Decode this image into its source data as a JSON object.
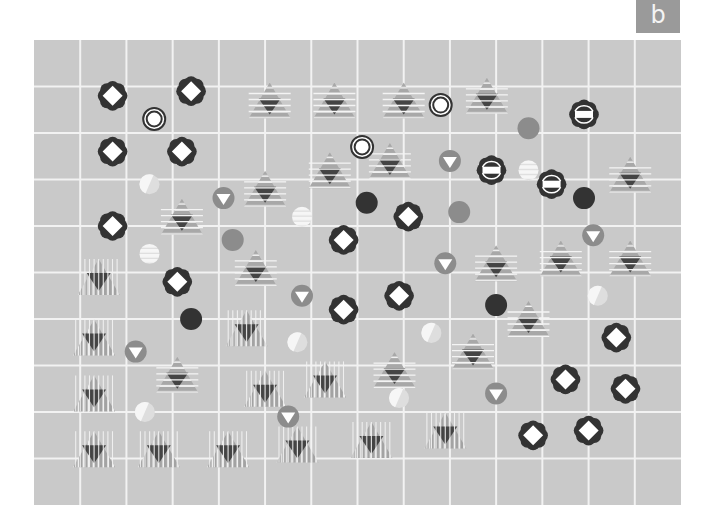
{
  "panel": {
    "label": "b"
  },
  "grid": {
    "columns": 14,
    "rows": 10
  },
  "colors": {
    "background": "#c9c9c9",
    "grid_line": "#f2f2f2",
    "dark": "#333333",
    "mid": "#8c8c8c",
    "stripe_light": "#a8a8a8",
    "light": "#eeeeee",
    "white": "#ffffff"
  },
  "symbol_types": {
    "flower": "dark flower with white diamond",
    "flower-bar": "dark flower with white bar",
    "ring": "double ring",
    "htri": "horizontally striped triangle with dark inner triangle",
    "vtri": "vertically striped triangle with dark inner triangle",
    "tri-down-circle": "gray circle with white down-triangle",
    "dot-dark": "dark circle",
    "dot-mid": "medium gray circle",
    "dot-light-half": "pale half-white circle",
    "dot-light-striped": "pale striped circle"
  },
  "symbols": [
    {
      "type": "flower",
      "col": 1.7,
      "row": 1.2
    },
    {
      "type": "flower",
      "col": 3.4,
      "row": 1.1
    },
    {
      "type": "flower",
      "col": 1.7,
      "row": 2.4
    },
    {
      "type": "flower",
      "col": 3.2,
      "row": 2.4
    },
    {
      "type": "flower",
      "col": 1.7,
      "row": 4.0
    },
    {
      "type": "flower",
      "col": 6.7,
      "row": 4.3
    },
    {
      "type": "flower",
      "col": 8.1,
      "row": 3.8
    },
    {
      "type": "flower",
      "col": 3.1,
      "row": 5.2
    },
    {
      "type": "flower",
      "col": 7.9,
      "row": 5.5
    },
    {
      "type": "flower",
      "col": 6.7,
      "row": 5.8
    },
    {
      "type": "flower",
      "col": 12.6,
      "row": 6.4
    },
    {
      "type": "flower",
      "col": 11.5,
      "row": 7.3
    },
    {
      "type": "flower",
      "col": 12.8,
      "row": 7.5
    },
    {
      "type": "flower",
      "col": 10.8,
      "row": 8.5
    },
    {
      "type": "flower",
      "col": 12.0,
      "row": 8.4
    },
    {
      "type": "flower-bar",
      "col": 11.9,
      "row": 1.6
    },
    {
      "type": "flower-bar",
      "col": 9.9,
      "row": 2.8
    },
    {
      "type": "flower-bar",
      "col": 11.2,
      "row": 3.1
    },
    {
      "type": "ring",
      "col": 2.6,
      "row": 1.7
    },
    {
      "type": "ring",
      "col": 8.8,
      "row": 1.4
    },
    {
      "type": "ring",
      "col": 7.1,
      "row": 2.3
    },
    {
      "type": "htri",
      "col": 5.1,
      "row": 1.3
    },
    {
      "type": "htri",
      "col": 6.5,
      "row": 1.3
    },
    {
      "type": "htri",
      "col": 8.0,
      "row": 1.3
    },
    {
      "type": "htri",
      "col": 9.8,
      "row": 1.2
    },
    {
      "type": "htri",
      "col": 6.4,
      "row": 2.8
    },
    {
      "type": "htri",
      "col": 7.7,
      "row": 2.6
    },
    {
      "type": "htri",
      "col": 5.0,
      "row": 3.2
    },
    {
      "type": "htri",
      "col": 3.2,
      "row": 3.8
    },
    {
      "type": "htri",
      "col": 12.9,
      "row": 2.9
    },
    {
      "type": "htri",
      "col": 4.8,
      "row": 4.9
    },
    {
      "type": "htri",
      "col": 10.0,
      "row": 4.8
    },
    {
      "type": "htri",
      "col": 11.4,
      "row": 4.7
    },
    {
      "type": "htri",
      "col": 12.9,
      "row": 4.7
    },
    {
      "type": "htri",
      "col": 10.7,
      "row": 6.0
    },
    {
      "type": "htri",
      "col": 9.5,
      "row": 6.7
    },
    {
      "type": "htri",
      "col": 7.8,
      "row": 7.1
    },
    {
      "type": "htri",
      "col": 3.1,
      "row": 7.2
    },
    {
      "type": "vtri",
      "col": 1.4,
      "row": 5.1
    },
    {
      "type": "vtri",
      "col": 1.3,
      "row": 6.4
    },
    {
      "type": "vtri",
      "col": 4.6,
      "row": 6.2
    },
    {
      "type": "vtri",
      "col": 1.3,
      "row": 7.6
    },
    {
      "type": "vtri",
      "col": 5.0,
      "row": 7.5
    },
    {
      "type": "vtri",
      "col": 6.3,
      "row": 7.3
    },
    {
      "type": "vtri",
      "col": 1.3,
      "row": 8.8
    },
    {
      "type": "vtri",
      "col": 2.7,
      "row": 8.8
    },
    {
      "type": "vtri",
      "col": 4.2,
      "row": 8.8
    },
    {
      "type": "vtri",
      "col": 5.7,
      "row": 8.7
    },
    {
      "type": "vtri",
      "col": 7.3,
      "row": 8.6
    },
    {
      "type": "vtri",
      "col": 8.9,
      "row": 8.4
    },
    {
      "type": "tri-down-circle",
      "col": 4.1,
      "row": 3.4
    },
    {
      "type": "tri-down-circle",
      "col": 9.0,
      "row": 2.6
    },
    {
      "type": "tri-down-circle",
      "col": 12.1,
      "row": 4.2
    },
    {
      "type": "tri-down-circle",
      "col": 8.9,
      "row": 4.8
    },
    {
      "type": "tri-down-circle",
      "col": 5.8,
      "row": 5.5
    },
    {
      "type": "tri-down-circle",
      "col": 2.2,
      "row": 6.7
    },
    {
      "type": "tri-down-circle",
      "col": 5.5,
      "row": 8.1
    },
    {
      "type": "tri-down-circle",
      "col": 10.0,
      "row": 7.6
    },
    {
      "type": "dot-dark",
      "col": 7.2,
      "row": 3.5
    },
    {
      "type": "dot-dark",
      "col": 11.9,
      "row": 3.4
    },
    {
      "type": "dot-dark",
      "col": 3.4,
      "row": 6.0
    },
    {
      "type": "dot-dark",
      "col": 10.0,
      "row": 5.7
    },
    {
      "type": "dot-mid",
      "col": 10.7,
      "row": 1.9
    },
    {
      "type": "dot-mid",
      "col": 4.3,
      "row": 4.3
    },
    {
      "type": "dot-mid",
      "col": 9.2,
      "row": 3.7
    },
    {
      "type": "dot-light-half",
      "col": 2.5,
      "row": 3.1
    },
    {
      "type": "dot-light-half",
      "col": 5.7,
      "row": 6.5
    },
    {
      "type": "dot-light-half",
      "col": 8.6,
      "row": 6.3
    },
    {
      "type": "dot-light-half",
      "col": 12.2,
      "row": 5.5
    },
    {
      "type": "dot-light-half",
      "col": 2.4,
      "row": 8.0
    },
    {
      "type": "dot-light-half",
      "col": 7.9,
      "row": 7.7
    },
    {
      "type": "dot-light-striped",
      "col": 5.8,
      "row": 3.8
    },
    {
      "type": "dot-light-striped",
      "col": 2.5,
      "row": 4.6
    },
    {
      "type": "dot-light-striped",
      "col": 10.7,
      "row": 2.8
    }
  ]
}
